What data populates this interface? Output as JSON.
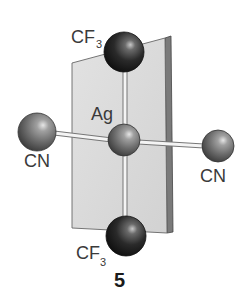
{
  "figure": {
    "compound_number": "5",
    "central_atom": {
      "label": "Ag",
      "type": "metal"
    },
    "ligands": [
      {
        "id": "top",
        "label_main": "CF",
        "label_sub": "3",
        "position": "axial-top",
        "shade": "dark"
      },
      {
        "id": "bottom",
        "label_main": "CF",
        "label_sub": "3",
        "position": "axial-bottom",
        "shade": "dark"
      },
      {
        "id": "left",
        "label_main": "CN",
        "position": "equatorial-left",
        "shade": "medium"
      },
      {
        "id": "right",
        "label_main": "CN",
        "position": "equatorial-right",
        "shade": "medium"
      }
    ],
    "plane": {
      "description": "coordination plane containing CF3–Ag–CF3 axis",
      "color": "#dcdcdc",
      "edge_color": "#555555"
    },
    "colors": {
      "dark_sphere": "#1e1e1e",
      "medium_sphere": "#6e6e6e",
      "highlight": "#d8d8d8",
      "bond_fill": "#f4f4f4",
      "bond_outline": "#777777",
      "text": "#3a3a3a"
    }
  }
}
